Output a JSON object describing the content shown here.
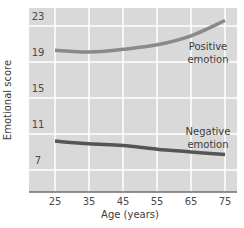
{
  "chart_data": {
    "type": "line",
    "title": "",
    "xlabel": "Age (years)",
    "ylabel": "Emotional score",
    "x": [
      25,
      35,
      45,
      55,
      65,
      75
    ],
    "x_ticks": [
      "25",
      "35",
      "45",
      "55",
      "65",
      "75"
    ],
    "y_ticks": [
      "23",
      "19",
      "15",
      "11",
      "7"
    ],
    "ylim": [
      4,
      24
    ],
    "xlim": [
      17,
      80
    ],
    "grid": true,
    "legend": "inline labels",
    "series": [
      {
        "name": "Positive emotion",
        "label_lines": [
          "Positive",
          "emotion"
        ],
        "values": [
          19.2,
          19.0,
          19.3,
          19.8,
          20.8,
          22.5
        ],
        "color": "#8a8a8a"
      },
      {
        "name": "Negative emotion",
        "label_lines": [
          "Negative",
          "emotion"
        ],
        "values": [
          9.1,
          8.8,
          8.6,
          8.2,
          7.9,
          7.6
        ],
        "color": "#555555"
      }
    ],
    "colors": {
      "plot_background": "#d9d9d9",
      "gridline": "#ffffff",
      "axis": "#6e6e6e"
    }
  }
}
